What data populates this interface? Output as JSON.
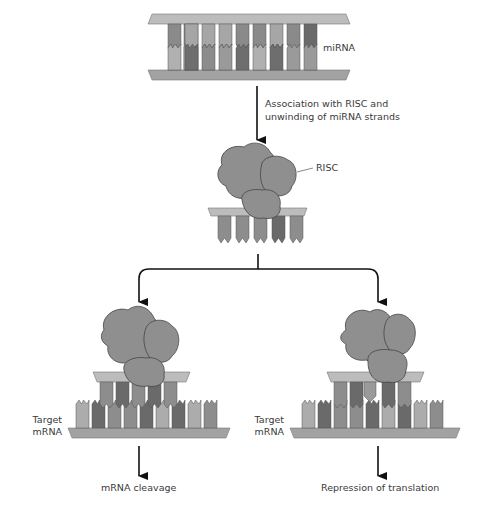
{
  "labels": {
    "mirna": "miRNA",
    "step1_line1": "Association with RISC and",
    "step1_line2": "unwinding of miRNA strands",
    "risc": "RISC",
    "target_left_line1": "Target",
    "target_left_line2": "mRNA",
    "target_right_line1": "Target",
    "target_right_line2": "mRNA",
    "outcome_left": "mRNA cleavage",
    "outcome_right": "Repression of translation"
  },
  "colors": {
    "backbone_light": "#b9b9b9",
    "backbone_dark": "#9d9d9d",
    "base_light": "#acacac",
    "base_mid": "#8d8d8d",
    "base_dark": "#6a6a6a",
    "risc_fill": "#8f8f8f",
    "arrow": "#111111"
  }
}
